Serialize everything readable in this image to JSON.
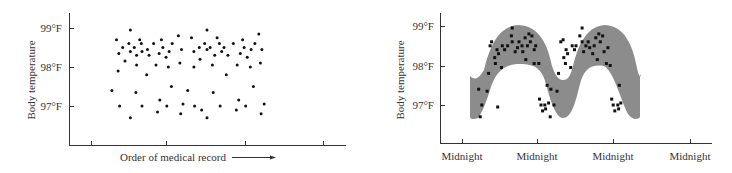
{
  "chart_data": [
    {
      "type": "scatter",
      "title": "",
      "xlabel": "Order of medical record",
      "ylabel": "Body temperature",
      "ytick_labels": [
        "99°F",
        "98°F",
        "97°F"
      ],
      "yticks": [
        99,
        98,
        97
      ],
      "ylim": [
        96.0,
        99.4
      ],
      "xticks": [
        1,
        2,
        3,
        4
      ],
      "xtick_labels": [
        "",
        "",
        "",
        ""
      ],
      "xlim": [
        0.7,
        4.3
      ],
      "grid": false,
      "legend": null,
      "x_arrow": true,
      "points": [
        [
          1.27,
          97.4
        ],
        [
          1.33,
          98.7
        ],
        [
          1.35,
          97.9
        ],
        [
          1.36,
          98.35
        ],
        [
          1.37,
          97.0
        ],
        [
          1.41,
          98.5
        ],
        [
          1.44,
          98.15
        ],
        [
          1.49,
          98.6
        ],
        [
          1.51,
          98.4
        ],
        [
          1.51,
          98.95
        ],
        [
          1.51,
          96.7
        ],
        [
          1.56,
          98.5
        ],
        [
          1.58,
          97.35
        ],
        [
          1.59,
          98.05
        ],
        [
          1.59,
          98.3
        ],
        [
          1.63,
          98.7
        ],
        [
          1.65,
          98.6
        ],
        [
          1.66,
          98.4
        ],
        [
          1.66,
          97.0
        ],
        [
          1.72,
          97.8
        ],
        [
          1.73,
          98.45
        ],
        [
          1.75,
          98.3
        ],
        [
          1.81,
          98.6
        ],
        [
          1.84,
          98.05
        ],
        [
          1.86,
          96.85
        ],
        [
          1.88,
          98.35
        ],
        [
          1.89,
          97.15
        ],
        [
          1.91,
          98.7
        ],
        [
          1.93,
          98.5
        ],
        [
          1.97,
          98.25
        ],
        [
          1.98,
          97.0
        ],
        [
          2.0,
          98.0
        ],
        [
          2.01,
          98.4
        ],
        [
          2.04,
          97.5
        ],
        [
          2.05,
          98.6
        ],
        [
          2.13,
          98.8
        ],
        [
          2.15,
          98.1
        ],
        [
          2.16,
          96.8
        ],
        [
          2.17,
          98.45
        ],
        [
          2.19,
          97.05
        ],
        [
          2.25,
          97.4
        ],
        [
          2.3,
          98.75
        ],
        [
          2.33,
          98.0
        ],
        [
          2.33,
          98.4
        ],
        [
          2.34,
          97.0
        ],
        [
          2.4,
          98.5
        ],
        [
          2.41,
          98.2
        ],
        [
          2.43,
          96.9
        ],
        [
          2.47,
          98.6
        ],
        [
          2.5,
          98.45
        ],
        [
          2.5,
          96.7
        ],
        [
          2.5,
          98.95
        ],
        [
          2.54,
          98.5
        ],
        [
          2.57,
          98.05
        ],
        [
          2.58,
          97.35
        ],
        [
          2.6,
          98.3
        ],
        [
          2.63,
          98.75
        ],
        [
          2.66,
          98.6
        ],
        [
          2.67,
          97.0
        ],
        [
          2.69,
          98.4
        ],
        [
          2.72,
          98.5
        ],
        [
          2.75,
          97.8
        ],
        [
          2.77,
          98.3
        ],
        [
          2.84,
          98.6
        ],
        [
          2.88,
          96.9
        ],
        [
          2.89,
          98.05
        ],
        [
          2.91,
          97.15
        ],
        [
          2.93,
          98.35
        ],
        [
          2.96,
          98.7
        ],
        [
          2.98,
          98.5
        ],
        [
          3.0,
          97.0
        ],
        [
          3.02,
          98.25
        ],
        [
          3.06,
          98.0
        ],
        [
          3.07,
          98.45
        ],
        [
          3.1,
          97.5
        ],
        [
          3.12,
          98.6
        ],
        [
          3.17,
          98.85
        ],
        [
          3.19,
          98.1
        ],
        [
          3.2,
          96.8
        ],
        [
          3.21,
          98.45
        ],
        [
          3.24,
          97.05
        ]
      ]
    },
    {
      "type": "scatter",
      "title": "",
      "xlabel": "",
      "ylabel": "Body temperature",
      "ytick_labels": [
        "99°F",
        "98°F",
        "97°F"
      ],
      "yticks": [
        99,
        98,
        97
      ],
      "ylim": [
        96.0,
        99.4
      ],
      "xticks": [
        0,
        1,
        2,
        3
      ],
      "xtick_labels": [
        "Midnight",
        "Midnight",
        "Midnight",
        "Midnight"
      ],
      "xlim": [
        -0.3,
        3.3
      ],
      "grid": false,
      "legend": null,
      "annotation": "Gray band shows the daily (circadian) cycle of body temperature",
      "band_color": "#8c8c8c",
      "points": [
        [
          0.22,
          97.4
        ],
        [
          0.24,
          96.7
        ],
        [
          0.26,
          97.0
        ],
        [
          0.33,
          97.35
        ],
        [
          0.35,
          97.8
        ],
        [
          0.37,
          98.5
        ],
        [
          0.39,
          98.6
        ],
        [
          0.43,
          98.2
        ],
        [
          0.44,
          98.05
        ],
        [
          0.46,
          98.4
        ],
        [
          0.48,
          98.3
        ],
        [
          0.47,
          96.95
        ],
        [
          0.52,
          97.95
        ],
        [
          0.53,
          98.5
        ],
        [
          0.56,
          98.4
        ],
        [
          0.6,
          98.5
        ],
        [
          0.65,
          98.75
        ],
        [
          0.66,
          98.95
        ],
        [
          0.66,
          98.6
        ],
        [
          0.7,
          98.35
        ],
        [
          0.73,
          98.45
        ],
        [
          0.75,
          98.6
        ],
        [
          0.79,
          98.5
        ],
        [
          0.8,
          98.35
        ],
        [
          0.83,
          98.7
        ],
        [
          0.84,
          98.15
        ],
        [
          0.86,
          98.5
        ],
        [
          0.88,
          98.8
        ],
        [
          0.9,
          98.6
        ],
        [
          0.92,
          98.75
        ],
        [
          0.95,
          98.4
        ],
        [
          0.95,
          98.05
        ],
        [
          0.97,
          98.5
        ],
        [
          1.01,
          98.05
        ],
        [
          1.02,
          97.15
        ],
        [
          1.04,
          97.0
        ],
        [
          1.06,
          96.85
        ],
        [
          1.09,
          97.0
        ],
        [
          1.1,
          96.9
        ],
        [
          1.12,
          97.5
        ],
        [
          1.14,
          97.05
        ],
        [
          1.16,
          96.7
        ],
        [
          1.17,
          97.4
        ],
        [
          1.21,
          97.0
        ],
        [
          1.25,
          97.35
        ],
        [
          1.27,
          97.8
        ],
        [
          1.3,
          98.6
        ],
        [
          1.33,
          98.65
        ],
        [
          1.34,
          98.2
        ],
        [
          1.36,
          98.05
        ],
        [
          1.37,
          98.4
        ],
        [
          1.39,
          98.3
        ],
        [
          1.43,
          97.95
        ],
        [
          1.45,
          98.5
        ],
        [
          1.48,
          98.4
        ],
        [
          1.5,
          98.5
        ],
        [
          1.55,
          98.75
        ],
        [
          1.58,
          98.95
        ],
        [
          1.58,
          98.6
        ],
        [
          1.6,
          98.35
        ],
        [
          1.63,
          98.5
        ],
        [
          1.66,
          98.6
        ],
        [
          1.68,
          98.45
        ],
        [
          1.72,
          98.3
        ],
        [
          1.74,
          98.5
        ],
        [
          1.76,
          98.7
        ],
        [
          1.78,
          98.15
        ],
        [
          1.8,
          98.8
        ],
        [
          1.82,
          98.6
        ],
        [
          1.85,
          98.75
        ],
        [
          1.87,
          98.35
        ],
        [
          1.9,
          98.05
        ],
        [
          1.92,
          98.45
        ],
        [
          1.95,
          98.0
        ],
        [
          1.97,
          97.15
        ],
        [
          1.99,
          97.0
        ],
        [
          2.01,
          96.85
        ],
        [
          2.05,
          97.0
        ],
        [
          2.06,
          96.9
        ],
        [
          2.07,
          97.5
        ],
        [
          2.09,
          97.05
        ]
      ]
    }
  ],
  "left_chart": {
    "ylabel": "Body temperature",
    "yticks": [
      "99°F",
      "98°F",
      "97°F"
    ],
    "xlabel": "Order of medical record"
  },
  "right_chart": {
    "ylabel": "Body temperature",
    "yticks": [
      "99°F",
      "98°F",
      "97°F"
    ],
    "xticks": [
      "Midnight",
      "Midnight",
      "Midnight",
      "Midnight"
    ]
  }
}
